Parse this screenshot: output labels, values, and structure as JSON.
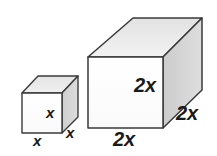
{
  "figure": {
    "background_color": "#ffffff",
    "stroke_color": "#333333",
    "face_colors": {
      "front": "#fcfcfc",
      "top": "#ececec",
      "side": "#d6d6d6"
    },
    "shapes": [
      {
        "name": "small-cube",
        "edge_length_label": "x",
        "labels": {
          "front_face": "x",
          "bottom_edge": "x",
          "depth_edge": "x"
        }
      },
      {
        "name": "large-cube",
        "edge_length_label": "2x",
        "labels": {
          "front_face": "2x",
          "bottom_edge": "2x",
          "depth_edge": "2x"
        }
      }
    ]
  }
}
